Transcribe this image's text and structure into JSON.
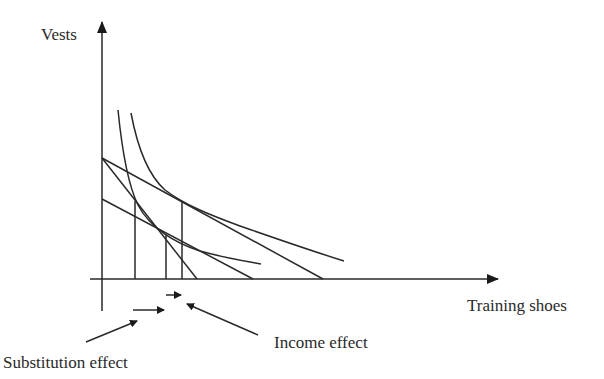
{
  "diagram": {
    "type": "indifference-curve-analysis",
    "axes": {
      "y_label": "Vests",
      "x_label": "Training shoes"
    },
    "annotations": {
      "substitution_effect": "Substitution effect",
      "income_effect": "Income effect"
    },
    "elements": {
      "budget_lines": [
        {
          "name": "original-budget-line",
          "from": [
            102,
            158
          ],
          "to": [
            323,
            279
          ]
        },
        {
          "name": "pivoted-budget-line",
          "from": [
            102,
            158
          ],
          "to": [
            197,
            279
          ]
        },
        {
          "name": "compensated-budget-line",
          "from": [
            102,
            199
          ],
          "to": [
            253,
            279
          ]
        }
      ],
      "indifference_curves": [
        {
          "name": "lower-indifference-curve"
        },
        {
          "name": "higher-indifference-curve"
        }
      ],
      "equilibrium_drops": [
        {
          "x": 135,
          "y": 201
        },
        {
          "x": 166,
          "y": 235
        },
        {
          "x": 182,
          "y": 202
        }
      ]
    },
    "colors": {
      "line": "#2a2a2a",
      "background": "#ffffff"
    }
  }
}
